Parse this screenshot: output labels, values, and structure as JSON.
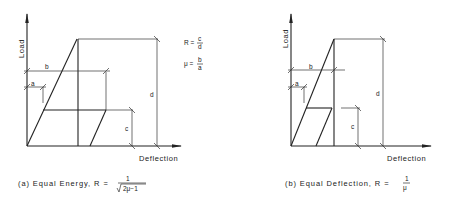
{
  "panels": [
    {
      "id": "a",
      "y_axis_label": "Load",
      "x_axis_label": "Deflection",
      "dimension_labels": {
        "a": "a",
        "b": "b",
        "c": "c",
        "d": "d"
      },
      "formulas": {
        "R_lhs": "R =",
        "R_num": "c",
        "R_den": "d",
        "mu_lhs": "μ =",
        "mu_num": "b",
        "mu_den": "a"
      },
      "caption": {
        "prefix": "(a)  Equal Energy,  R =",
        "num": "1",
        "den": "2μ−1"
      }
    },
    {
      "id": "b",
      "y_axis_label": "Load",
      "x_axis_label": "Deflection",
      "dimension_labels": {
        "a": "a",
        "b": "b",
        "c": "c",
        "d": "d"
      },
      "caption": {
        "prefix": "(b) Equal  Deflection,  R =",
        "num": "1",
        "den": "μ"
      }
    }
  ],
  "colors": {
    "ink": "#222222",
    "background": "#ffffff"
  }
}
